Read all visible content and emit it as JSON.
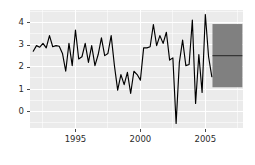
{
  "chart_data": {
    "type": "line",
    "title": "",
    "subtitle": "",
    "xlabel": "",
    "ylabel": "",
    "xlim": [
      1991.5,
      2007.9
    ],
    "ylim": [
      -0.75,
      4.55
    ],
    "grid": true,
    "legend": null,
    "panel_background": "#EBEBEB",
    "gridline_color": "#FFFFFF",
    "line_color": "#000000",
    "forecast_band_color": "#808080",
    "forecast_line_color": "#333333",
    "y_ticks": [
      0,
      1,
      2,
      3,
      4
    ],
    "y_tick_labels": [
      "0",
      "1",
      "2",
      "3",
      "4"
    ],
    "x_ticks": [
      1995,
      2000,
      2005
    ],
    "x_tick_labels": [
      "1995",
      "2000",
      "2005"
    ],
    "series": [
      {
        "name": "observed",
        "x": [
          1991.75,
          1992.0,
          1992.25,
          1992.5,
          1992.75,
          1993.0,
          1993.25,
          1993.5,
          1993.75,
          1994.0,
          1994.25,
          1994.5,
          1994.75,
          1995.0,
          1995.25,
          1995.5,
          1995.75,
          1996.0,
          1996.25,
          1996.5,
          1996.75,
          1997.0,
          1997.25,
          1997.5,
          1997.75,
          1998.0,
          1998.25,
          1998.5,
          1998.75,
          1999.0,
          1999.25,
          1999.5,
          1999.75,
          2000.0,
          2000.25,
          2000.5,
          2000.75,
          2001.0,
          2001.25,
          2001.5,
          2001.75,
          2002.0,
          2002.25,
          2002.5,
          2002.75,
          2003.0,
          2003.25,
          2003.5,
          2003.75,
          2004.0,
          2004.25,
          2004.5,
          2004.75,
          2005.0,
          2005.25,
          2005.5
        ],
        "y": [
          2.7,
          2.95,
          2.88,
          3.05,
          2.85,
          3.4,
          2.9,
          2.95,
          2.92,
          2.6,
          1.8,
          3.05,
          2.05,
          3.65,
          2.35,
          2.45,
          3.05,
          2.2,
          2.95,
          2.05,
          2.55,
          3.3,
          2.5,
          2.6,
          3.4,
          2.05,
          0.95,
          1.65,
          1.2,
          1.75,
          0.8,
          1.8,
          1.65,
          1.4,
          2.85,
          2.85,
          2.9,
          3.9,
          2.95,
          3.4,
          3.05,
          3.55,
          2.3,
          2.4,
          -0.55,
          2.2,
          3.2,
          2.05,
          2.1,
          4.1,
          0.35,
          2.55,
          0.85,
          4.35,
          2.45,
          1.55
        ]
      }
    ],
    "forecast": {
      "name": "forecast",
      "x_start": 2005.55,
      "x_end": 2007.85,
      "point_value": 2.5,
      "interval_low": 1.08,
      "interval_high": 3.92,
      "band_color": "#808080"
    }
  }
}
